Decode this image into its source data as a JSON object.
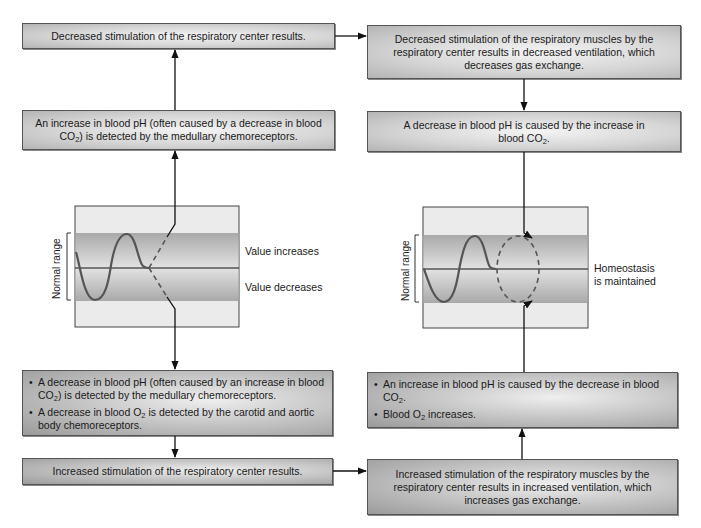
{
  "left_column": {
    "box_top": {
      "text": "Decreased stimulation of the respiratory center results."
    },
    "box_detect_increase": {
      "line1": "An increase in blood pH (often caused by a decrease in blood",
      "line2_pre": "CO",
      "line2_sub": "2",
      "line2_post": ") is detected by the medullary chemoreceptors."
    },
    "graph": {
      "axis_label": "Normal range",
      "label_up": "Value increases",
      "label_down": "Value decreases"
    },
    "box_detect_decrease": {
      "bullet_char": "•",
      "bullet1_line1": "A decrease in blood pH (often caused by an increase in blood",
      "bullet1_line2_pre": "CO",
      "bullet1_line2_sub": "2",
      "bullet1_line2_post": ") is detected by the medullary chemoreceptors.",
      "bullet2_pre": "A decrease in blood O",
      "bullet2_sub": "2",
      "bullet2_post": " is detected by the carotid and aortic body chemoreceptors."
    },
    "box_bottom": {
      "text": "Increased stimulation of the respiratory center results."
    }
  },
  "right_column": {
    "box_top": {
      "text": "Decreased stimulation of the respiratory muscles by the respiratory center results in decreased ventilation, which decreases gas exchange."
    },
    "box_ph_decrease": {
      "line1": "A decrease in blood pH is caused by the increase in",
      "line2_pre": "blood CO",
      "line2_sub": "2",
      "line2_post": "."
    },
    "graph": {
      "axis_label": "Normal range",
      "label_line1": "Homeostasis",
      "label_line2": "is maintained"
    },
    "box_ph_increase": {
      "bullet_char": "•",
      "bullet1_line1": "An increase in blood pH is caused by the decrease in blood",
      "bullet1_line2_pre": "CO",
      "bullet1_line2_sub": "2",
      "bullet1_line2_post": ".",
      "bullet2_pre": "Blood O",
      "bullet2_sub": "2",
      "bullet2_post": " increases."
    },
    "box_bottom": {
      "text": "Increased stimulation of the respiratory muscles by the respiratory center results in increased ventilation, which increases gas exchange."
    }
  },
  "colors": {
    "box_border": "#555555",
    "normal_band": "#b8b8b8",
    "graph_bg": "#e6e6e6",
    "wave": "#555555",
    "arrow": "#111111"
  }
}
